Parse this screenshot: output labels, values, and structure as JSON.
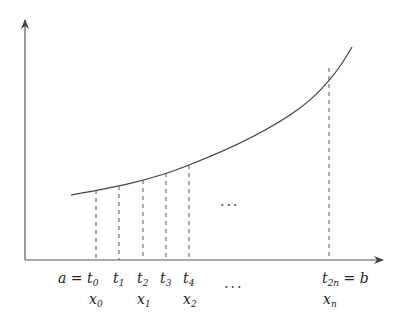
{
  "diagram": {
    "colors": {
      "axis": "#555555",
      "curve": "#444444",
      "dashed": "#555555",
      "text": "#222222"
    },
    "t_labels": [
      {
        "prefix": "a = ",
        "base": "t",
        "sub": "0",
        "x": 96
      },
      {
        "prefix": "",
        "base": "t",
        "sub": "1",
        "x": 119
      },
      {
        "prefix": "",
        "base": "t",
        "sub": "2",
        "x": 143
      },
      {
        "prefix": "",
        "base": "t",
        "sub": "3",
        "x": 166
      },
      {
        "prefix": "",
        "base": "t",
        "sub": "4",
        "x": 189
      },
      {
        "prefix": "",
        "base": "t",
        "sub": "2n",
        "suffix": " = b",
        "x": 329
      }
    ],
    "x_labels": [
      {
        "base": "x",
        "sub": "0",
        "x": 96
      },
      {
        "base": "x",
        "sub": "1",
        "x": 143
      },
      {
        "base": "x",
        "sub": "2",
        "x": 189
      },
      {
        "base": "x",
        "sub": "n",
        "x": 329
      }
    ],
    "ellipsis": "···",
    "ellipsis_mid": "···",
    "partition_x": [
      96,
      119,
      143,
      166,
      189,
      329
    ]
  }
}
